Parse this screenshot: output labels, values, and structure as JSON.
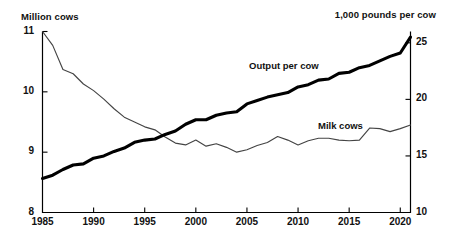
{
  "chart_data": {
    "type": "line",
    "title": "",
    "xlabel": "",
    "x_ticks": [
      "1985",
      "1990",
      "1995",
      "2000",
      "2005",
      "2010",
      "2015",
      "2020"
    ],
    "x_tick_values": [
      1985,
      1990,
      1995,
      2000,
      2005,
      2010,
      2015,
      2020
    ],
    "xlim": [
      1985,
      2021
    ],
    "grid": false,
    "legend_position": "inline-annotations",
    "axes": [
      {
        "id": "left",
        "axis_title": "Million cows",
        "ylabel": "Million cows",
        "ylim": [
          8,
          11
        ],
        "ticks": [
          8,
          9,
          10,
          11
        ],
        "tick_labels": [
          "8",
          "9",
          "10",
          "11"
        ]
      },
      {
        "id": "right",
        "axis_title": "1,000 pounds per cow",
        "ylabel": "1,000 pounds per cow",
        "ylim": [
          10,
          26
        ],
        "ticks": [
          10,
          15,
          20,
          25
        ],
        "tick_labels": [
          "10",
          "15",
          "20",
          "25"
        ]
      }
    ],
    "series": [
      {
        "name": "Milk cows",
        "label": "Milk cows",
        "axis": "left",
        "units": "million cows",
        "style": "thin-line",
        "color": "#444444",
        "x": [
          1985,
          1986,
          1987,
          1988,
          1989,
          1990,
          1991,
          1992,
          1993,
          1994,
          1995,
          1996,
          1997,
          1998,
          1999,
          2000,
          2001,
          2002,
          2003,
          2004,
          2005,
          2006,
          2007,
          2008,
          2009,
          2010,
          2011,
          2012,
          2013,
          2014,
          2015,
          2016,
          2017,
          2018,
          2019,
          2020,
          2021
        ],
        "values": [
          11.0,
          10.77,
          10.37,
          10.3,
          10.13,
          10.02,
          9.88,
          9.72,
          9.58,
          9.5,
          9.42,
          9.37,
          9.25,
          9.15,
          9.12,
          9.2,
          9.1,
          9.14,
          9.08,
          9.0,
          9.04,
          9.11,
          9.16,
          9.26,
          9.2,
          9.12,
          9.19,
          9.23,
          9.23,
          9.2,
          9.19,
          9.2,
          9.4,
          9.39,
          9.34,
          9.39,
          9.45
        ],
        "first_value": 11.0,
        "last_value": 9.45,
        "min_value": 9.0,
        "max_value": 11.0
      },
      {
        "name": "Output per cow",
        "label": "Output per cow",
        "axis": "right",
        "units": "1,000 pounds per cow",
        "style": "thick-line",
        "color": "#000000",
        "x": [
          1985,
          1986,
          1987,
          1988,
          1989,
          1990,
          1991,
          1992,
          1993,
          1994,
          1995,
          1996,
          1997,
          1998,
          1999,
          2000,
          2001,
          2002,
          2003,
          2004,
          2005,
          2006,
          2007,
          2008,
          2009,
          2010,
          2011,
          2012,
          2013,
          2014,
          2015,
          2016,
          2017,
          2018,
          2019,
          2020,
          2021
        ],
        "values": [
          13.0,
          13.3,
          13.8,
          14.2,
          14.3,
          14.8,
          15.0,
          15.4,
          15.7,
          16.2,
          16.4,
          16.5,
          16.9,
          17.2,
          17.8,
          18.2,
          18.2,
          18.6,
          18.8,
          18.9,
          19.6,
          19.9,
          20.2,
          20.4,
          20.6,
          21.1,
          21.3,
          21.7,
          21.8,
          22.3,
          22.4,
          22.8,
          23.0,
          23.4,
          23.8,
          24.1,
          25.5
        ],
        "first_value": 13.0,
        "last_value": 25.5,
        "min_value": 13.0,
        "max_value": 25.5
      }
    ]
  },
  "annotations": {
    "output_label": "Output per cow",
    "milk_label": "Milk cows"
  }
}
